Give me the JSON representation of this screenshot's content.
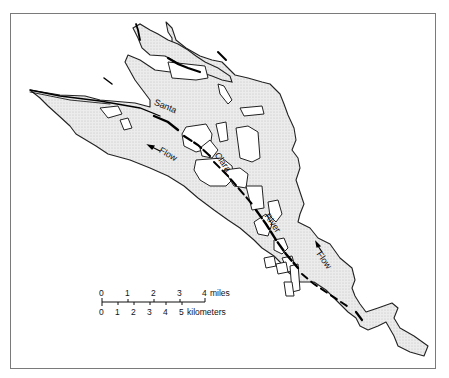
{
  "map": {
    "labels": {
      "river_word1": "Santa",
      "river_word2": "Clara",
      "river_word3": "River",
      "flow_upper": "Flow",
      "flow_lower": "Flow"
    },
    "colors": {
      "floodplain_fill": "#e6e6e6",
      "outline": "#222222",
      "channel": "#000000",
      "frame": "#7a7a7a"
    }
  },
  "scale_bar": {
    "miles_ticks": [
      "0",
      "1",
      "2",
      "3",
      "4"
    ],
    "miles_unit": "miles",
    "km_ticks": [
      "0",
      "1",
      "2",
      "3",
      "4",
      "5"
    ],
    "km_unit": "kilometers"
  }
}
